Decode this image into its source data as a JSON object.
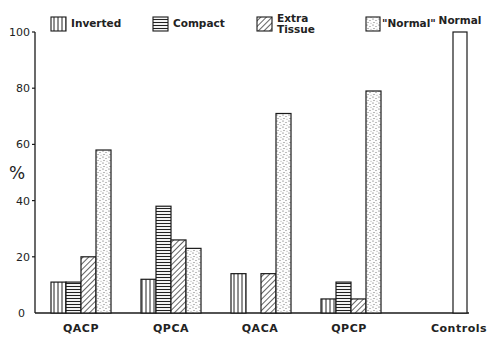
{
  "chart_data": {
    "type": "bar",
    "title": "",
    "xlabel": "",
    "ylabel": "%",
    "ylim": [
      0,
      100
    ],
    "yticks": [
      0,
      20,
      40,
      60,
      80,
      100
    ],
    "grid": false,
    "legend_position": "top",
    "categories": [
      "QACP",
      "QPCA",
      "QACA",
      "QPCP",
      "Controls"
    ],
    "series": [
      {
        "name": "Inverted",
        "pattern": "vertical-lines",
        "values": [
          11,
          12,
          14,
          5,
          0
        ]
      },
      {
        "name": "Compact",
        "pattern": "horizontal-lines",
        "values": [
          11,
          38,
          0,
          11,
          0
        ]
      },
      {
        "name": "Extra Tissue",
        "pattern": "diagonal-lines",
        "values": [
          20,
          26,
          14,
          5,
          0
        ]
      },
      {
        "name": "\"Normal\"",
        "pattern": "stipple",
        "values": [
          58,
          23,
          71,
          79,
          0
        ]
      },
      {
        "name": "Normal",
        "pattern": "blank",
        "values": [
          0,
          0,
          0,
          0,
          100
        ]
      }
    ],
    "annotations": [
      {
        "text": "Normal",
        "target": "Controls bar"
      }
    ]
  },
  "legend": {
    "items": [
      {
        "label": "Inverted",
        "pattern": "vertical-lines"
      },
      {
        "label": "Compact",
        "pattern": "horizontal-lines"
      },
      {
        "label_line1": "Extra",
        "label_line2": "Tissue",
        "pattern": "diagonal-lines"
      },
      {
        "label": "\"Normal\"",
        "pattern": "stipple"
      }
    ]
  },
  "controls_label": "Normal",
  "colors": {
    "ink": "#1a1a1a",
    "background": "#ffffff"
  }
}
